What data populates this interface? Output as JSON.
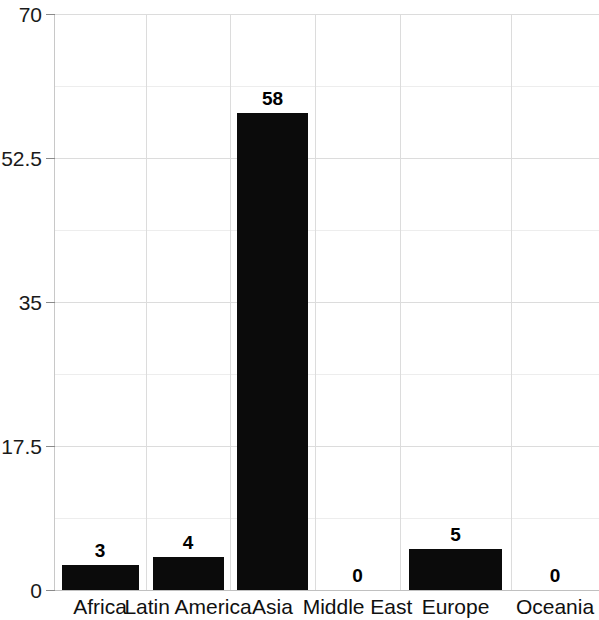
{
  "chart_data": {
    "type": "bar",
    "title": "",
    "subtitle": "",
    "xlabel": "",
    "ylabel": "",
    "categories": [
      "Africa",
      "Latin America",
      "Asia",
      "Middle East",
      "Europe",
      "Oceania"
    ],
    "values": [
      3,
      4,
      58,
      0,
      5,
      0
    ],
    "data_labels": [
      "3",
      "4",
      "58",
      "0",
      "5",
      "0"
    ],
    "ylim": [
      0,
      70
    ],
    "yticks": [
      0,
      17.5,
      35,
      52.5,
      70
    ],
    "ytick_labels": [
      "0",
      "17.5",
      "35",
      "52.5",
      "70"
    ],
    "y_minor_ticks": [
      8.75,
      26.25,
      43.75,
      61.25
    ],
    "grid": true,
    "grid_horizontal": true,
    "grid_vertical": true,
    "legend": false,
    "legend_position": "none",
    "bar_color": "#0b0b0b",
    "grid_color": "#dcdcdc",
    "axis_color": "#c0c0c0",
    "background_color": "#ffffff",
    "text_color": "#101010"
  }
}
